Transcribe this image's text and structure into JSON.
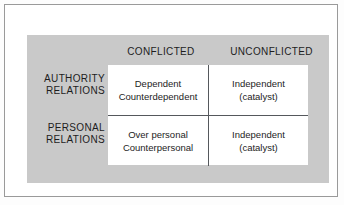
{
  "figure": {
    "type": "2x2-matrix-diagram",
    "panel_color": "#c9c9c9",
    "cell_background": "#ffffff",
    "text_color": "#1d1d1d",
    "rule_color": "#55585c"
  },
  "columns": [
    {
      "key": "conflicted",
      "label": "CONFLICTED"
    },
    {
      "key": "unconflicted",
      "label": "UNCONFLICTED"
    }
  ],
  "rows": [
    {
      "key": "authority",
      "label_line1": "AUTHORITY",
      "label_line2": "RELATIONS",
      "cells": [
        {
          "line1": "Dependent",
          "line2": "Counterdependent"
        },
        {
          "line1": "Independent",
          "line2": "(catalyst)"
        }
      ]
    },
    {
      "key": "personal",
      "label_line1": "PERSONAL",
      "label_line2": "RELATIONS",
      "cells": [
        {
          "line1": "Over personal",
          "line2": "Counterpersonal"
        },
        {
          "line1": "Independent",
          "line2": "(catalyst)"
        }
      ]
    }
  ]
}
